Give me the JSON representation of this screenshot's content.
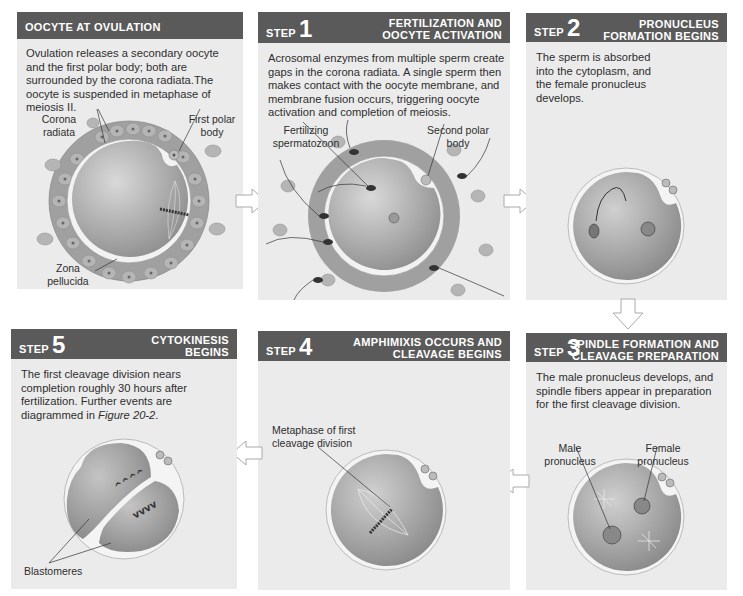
{
  "figure": {
    "panels": [
      {
        "id": "ovulation",
        "step_prefix": "",
        "step_number": "",
        "title_line1": "OOCYTE AT OVULATION",
        "title_line2": "",
        "description": "Ovulation releases a secondary oocyte and the first polar body; both are surrounded by the corona radiata.The oocyte is suspended in metaphase of meiosis II.",
        "labels": [
          "Corona radiata",
          "First polar body",
          "Zona pellucida"
        ]
      },
      {
        "id": "step1",
        "step_prefix": "STEP",
        "step_number": "1",
        "title_line1": "FERTILIZATION AND",
        "title_line2": "OOCYTE ACTIVATION",
        "description": "Acrosomal enzymes from multiple sperm create gaps in the corona radiata. A single sperm then makes contact with the oocyte membrane, and membrane fusion occurs, triggering oocyte activation and completion of meiosis.",
        "labels": [
          "Fertilizing spermatozoon",
          "Second polar body"
        ]
      },
      {
        "id": "step2",
        "step_prefix": "STEP",
        "step_number": "2",
        "title_line1": "PRONUCLEUS",
        "title_line2": "FORMATION BEGINS",
        "description": "The sperm is absorbed into the cytoplasm, and the female pronucleus develops.",
        "labels": []
      },
      {
        "id": "step3",
        "step_prefix": "STEP",
        "step_number": "3",
        "title_line1": "SPINDLE FORMATION AND",
        "title_line2": "CLEAVAGE PREPARATION",
        "description": "The male pronucleus develops, and spindle fibers appear in preparation for the first cleavage division.",
        "labels": [
          "Male pronucleus",
          "Female pronucleus"
        ]
      },
      {
        "id": "step4",
        "step_prefix": "STEP",
        "step_number": "4",
        "title_line1": "AMPHIMIXIS OCCURS AND",
        "title_line2": "CLEAVAGE BEGINS",
        "description": "",
        "labels": [
          "Metaphase of first cleavage division"
        ]
      },
      {
        "id": "step5",
        "step_prefix": "STEP",
        "step_number": "5",
        "title_line1": "CYTOKINESIS",
        "title_line2": "BEGINS",
        "description_main": "The first cleavage division nears completion roughly 30 hours after fertilization. Further events are diagrammed in ",
        "description_ref": "Figure 20-2",
        "description_end": ".",
        "labels": [
          "Blastomeres"
        ]
      }
    ],
    "label_lines": {
      "corona_1": "Corona",
      "corona_2": "radiata",
      "first_polar_1": "First polar",
      "first_polar_2": "body",
      "zona_1": "Zona",
      "zona_2": "pellucida",
      "fert_1": "Fertilizing",
      "fert_2": "spermatozoon",
      "second_polar_1": "Second polar",
      "second_polar_2": "body",
      "male_1": "Male",
      "male_2": "pronucleus",
      "female_1": "Female",
      "female_2": "pronucleus",
      "meta_1": "Metaphase of first",
      "meta_2": "cleavage division",
      "blasto": "Blastomeres"
    },
    "colors": {
      "header_bg": "#5a5a5a",
      "panel_bg": "#ebebeb",
      "oocyte": "#a8a8a8",
      "cell": "#9a9a9a",
      "arrow": "#ffffff"
    },
    "arrows": [
      "right",
      "right",
      "down",
      "left",
      "left"
    ]
  }
}
